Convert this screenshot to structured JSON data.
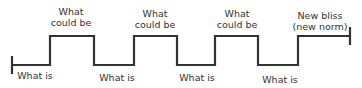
{
  "diagram": {
    "type": "step-waveform",
    "line_color": "#333333",
    "levels": {
      "high_y": 36,
      "low_y": 65
    },
    "labels_high": [
      {
        "line1": "What",
        "line2": "could be"
      },
      {
        "line1": "What",
        "line2": "could be"
      },
      {
        "line1": "What",
        "line2": "could be"
      },
      {
        "line1": "New bliss",
        "line2": "(new norm)"
      }
    ],
    "labels_low": [
      "What is",
      "What is",
      "What is",
      "What is"
    ]
  }
}
